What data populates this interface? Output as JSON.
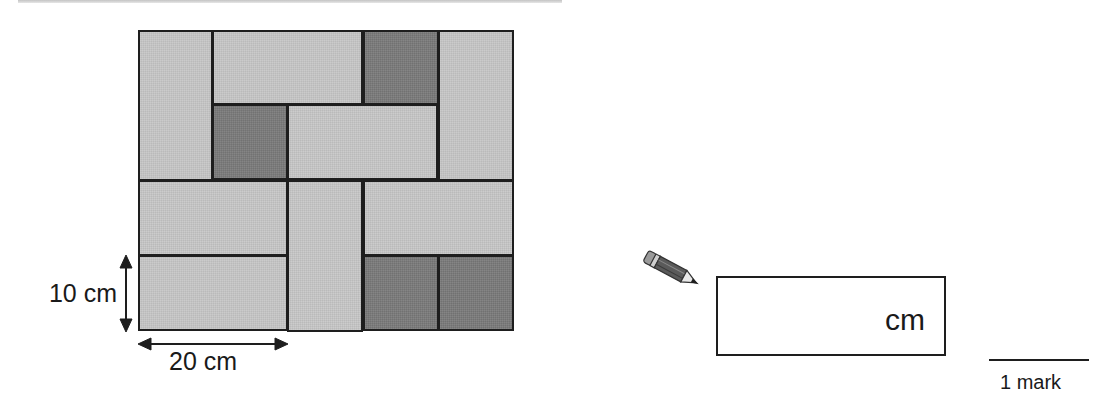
{
  "diagram": {
    "unit_px": 75.2,
    "grid_units": {
      "cols": 5,
      "rows": 4
    },
    "colors": {
      "light_tile": "#c6c6c6",
      "dark_tile": "#7b7b7b",
      "outline": "#1e1e1e"
    },
    "tiles": [
      {
        "shade": "light",
        "col": 0,
        "row": 0,
        "w": 1,
        "h": 2
      },
      {
        "shade": "light",
        "col": 1,
        "row": 0,
        "w": 2,
        "h": 1
      },
      {
        "shade": "dark",
        "col": 3,
        "row": 0,
        "w": 1,
        "h": 1
      },
      {
        "shade": "light",
        "col": 4,
        "row": 0,
        "w": 1,
        "h": 2
      },
      {
        "shade": "dark",
        "col": 1,
        "row": 1,
        "w": 1,
        "h": 1
      },
      {
        "shade": "light",
        "col": 2,
        "row": 1,
        "w": 2,
        "h": 1
      },
      {
        "shade": "light",
        "col": 0,
        "row": 2,
        "w": 2,
        "h": 1
      },
      {
        "shade": "light",
        "col": 2,
        "row": 2,
        "w": 1,
        "h": 2
      },
      {
        "shade": "light",
        "col": 3,
        "row": 2,
        "w": 2,
        "h": 1
      },
      {
        "shade": "light",
        "col": 0,
        "row": 3,
        "w": 2,
        "h": 1
      },
      {
        "shade": "dark",
        "col": 3,
        "row": 3,
        "w": 1,
        "h": 1
      },
      {
        "shade": "dark",
        "col": 4,
        "row": 3,
        "w": 1,
        "h": 1
      }
    ],
    "dimensions": {
      "height_label": "10 cm",
      "width_label": "20 cm"
    }
  },
  "answer": {
    "pencil_icon": "pencil-icon",
    "value": "",
    "unit": "cm",
    "marks_label": "1 mark"
  }
}
